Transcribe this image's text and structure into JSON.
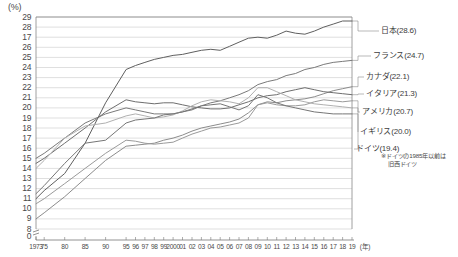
{
  "axis": {
    "unit_label": "(%)",
    "x_unit_label": "(年)",
    "y_ticks": [
      "29",
      "28",
      "17",
      "26",
      "25",
      "24",
      "23",
      "22",
      "21",
      "20",
      "19",
      "18",
      "17",
      "16",
      "15",
      "14",
      "13",
      "12",
      "11",
      "10",
      "9",
      "8",
      "0"
    ],
    "x_ticks": [
      "1973",
      "75",
      "80",
      "85",
      "90",
      "95",
      "96",
      "97",
      "98",
      "99",
      "2000",
      "01",
      "02",
      "03",
      "04",
      "05",
      "06",
      "07",
      "08",
      "09",
      "10",
      "11",
      "12",
      "13",
      "14",
      "15",
      "16",
      "17",
      "18",
      "19"
    ]
  },
  "legend": {
    "items": [
      {
        "label": "日本(28.6)",
        "country": "japan",
        "value": 28.6,
        "color": "#5f5f5f"
      },
      {
        "label": "フランス(24.7)",
        "country": "france",
        "value": 24.7,
        "color": "#7a7a7a"
      },
      {
        "label": "カナダ(22.1)",
        "country": "canada",
        "value": 22.1,
        "color": "#8c8c8c"
      },
      {
        "label": "イタリア(21.3)",
        "country": "italy",
        "value": 21.3,
        "color": "#6e6e6e"
      },
      {
        "label": "アメリカ(20.7)",
        "country": "usa",
        "value": 20.7,
        "color": "#9a9a9a"
      },
      {
        "label": "イギリス(20.0)",
        "country": "uk",
        "value": 20.0,
        "color": "#b0b0b0"
      },
      {
        "label": "ドイツ(19.4)",
        "country": "germany",
        "value": 19.4,
        "color": "#767676"
      }
    ]
  },
  "footnote": {
    "line1": "※ドイツの1985年以前は",
    "line2": "旧西ドイツ"
  },
  "chart_data": {
    "type": "line",
    "title": "",
    "xlabel": "(年)",
    "ylabel": "(%)",
    "ylim": [
      8,
      29
    ],
    "grid": true,
    "legend_position": "right",
    "x": [
      "1973",
      "75",
      "80",
      "85",
      "90",
      "95",
      "96",
      "97",
      "98",
      "99",
      "2000",
      "01",
      "02",
      "03",
      "04",
      "05",
      "06",
      "07",
      "08",
      "09",
      "10",
      "11",
      "12",
      "13",
      "14",
      "15",
      "16",
      "17",
      "18",
      "19"
    ],
    "series": [
      {
        "name": "日本",
        "color": "#5f5f5f",
        "values": [
          11.0,
          11.8,
          13.5,
          16.5,
          20.5,
          23.8,
          24.2,
          24.5,
          24.8,
          25.0,
          25.2,
          25.3,
          25.5,
          25.7,
          25.8,
          25.7,
          26.1,
          26.5,
          26.9,
          27.0,
          26.9,
          27.2,
          27.6,
          27.4,
          27.3,
          27.6,
          28.0,
          28.3,
          28.6,
          28.6
        ]
      },
      {
        "name": "フランス",
        "color": "#7a7a7a",
        "values": [
          15.0,
          15.5,
          17.0,
          18.5,
          19.4,
          20.0,
          19.8,
          19.6,
          19.4,
          19.4,
          19.4,
          19.6,
          19.8,
          20.2,
          20.5,
          20.7,
          21.0,
          21.3,
          21.7,
          22.3,
          22.6,
          22.8,
          23.2,
          23.4,
          23.8,
          24.0,
          24.3,
          24.5,
          24.6,
          24.7
        ]
      },
      {
        "name": "カナダ",
        "color": "#8c8c8c",
        "values": [
          9.0,
          9.6,
          11.2,
          13.0,
          14.8,
          16.2,
          16.3,
          16.4,
          16.5,
          16.8,
          17.0,
          17.3,
          17.7,
          18.0,
          18.2,
          18.4,
          18.6,
          18.9,
          19.5,
          20.3,
          20.6,
          20.5,
          20.7,
          20.8,
          20.9,
          21.1,
          21.4,
          21.7,
          21.9,
          22.1
        ]
      },
      {
        "name": "イタリア",
        "color": "#6e6e6e",
        "values": [
          14.5,
          15.0,
          16.5,
          18.0,
          19.6,
          20.8,
          20.6,
          20.5,
          20.4,
          20.5,
          20.5,
          20.3,
          20.1,
          20.0,
          19.9,
          19.9,
          20.0,
          20.3,
          20.6,
          21.0,
          21.2,
          21.3,
          21.6,
          21.8,
          22.0,
          21.8,
          21.6,
          21.5,
          21.4,
          21.3
        ]
      },
      {
        "name": "アメリカ",
        "color": "#9a9a9a",
        "values": [
          10.5,
          11.0,
          12.5,
          14.0,
          15.5,
          16.8,
          16.7,
          16.5,
          16.4,
          16.5,
          16.6,
          17.0,
          17.4,
          17.7,
          18.0,
          18.1,
          18.3,
          18.5,
          19.0,
          20.3,
          20.5,
          20.3,
          20.2,
          20.2,
          20.3,
          20.6,
          20.8,
          20.7,
          20.6,
          20.7
        ]
      },
      {
        "name": "イギリス",
        "color": "#b0b0b0",
        "values": [
          14.0,
          14.8,
          17.0,
          18.2,
          18.5,
          19.2,
          19.4,
          19.2,
          19.0,
          19.1,
          19.3,
          19.7,
          20.2,
          20.6,
          20.8,
          20.7,
          20.6,
          20.4,
          21.0,
          22.0,
          22.0,
          21.6,
          21.2,
          20.8,
          20.6,
          20.4,
          20.3,
          20.2,
          20.1,
          20.0
        ]
      },
      {
        "name": "ドイツ",
        "color": "#767676",
        "values": [
          11.5,
          12.3,
          14.5,
          16.5,
          16.8,
          18.5,
          18.8,
          18.9,
          19.0,
          19.3,
          19.4,
          19.6,
          19.9,
          20.2,
          20.3,
          20.4,
          20.1,
          19.8,
          20.2,
          21.3,
          21.0,
          20.5,
          20.2,
          20.0,
          19.8,
          19.6,
          19.5,
          19.4,
          19.4,
          19.4
        ]
      }
    ]
  }
}
